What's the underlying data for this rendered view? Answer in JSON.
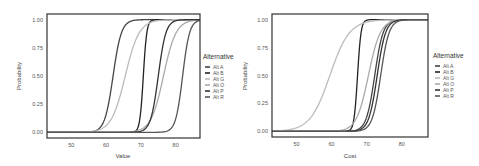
{
  "chart_data": [
    {
      "type": "line",
      "title": "",
      "xlabel": "Value",
      "ylabel": "Probability",
      "xlim": [
        43,
        87
      ],
      "ylim": [
        -0.05,
        1.05
      ],
      "xticks": [
        50,
        60,
        70,
        80
      ],
      "yticks": [
        "0.00",
        "0.25",
        "0.50",
        "0.75",
        "1.00"
      ],
      "grid": false,
      "legend": {
        "title": "Alternative",
        "placement": "right",
        "entries": [
          "Alt A",
          "Alt B",
          "Alt G",
          "Alt O",
          "Alt P",
          "Alt R"
        ]
      },
      "series": [
        {
          "name": "Alt A",
          "color": "#444444",
          "midpoint": 62.0,
          "spread": 1.2
        },
        {
          "name": "Alt B",
          "color": "#222222",
          "midpoint": 70.7,
          "spread": 0.5
        },
        {
          "name": "Alt G",
          "color": "#bbbbbb",
          "midpoint": 65.5,
          "spread": 2.0
        },
        {
          "name": "Alt O",
          "color": "#aaaaaa",
          "midpoint": 76.5,
          "spread": 1.8
        },
        {
          "name": "Alt P",
          "color": "#333333",
          "midpoint": 75.0,
          "spread": 1.1
        },
        {
          "name": "Alt R",
          "color": "#555555",
          "midpoint": 82.0,
          "spread": 1.0
        }
      ]
    },
    {
      "type": "line",
      "title": "",
      "xlabel": "Cost",
      "ylabel": "Probability",
      "xlim": [
        43,
        87.5
      ],
      "ylim": [
        -0.05,
        1.05
      ],
      "xticks": [
        50,
        60,
        70,
        80
      ],
      "yticks": [
        "0.00",
        "0.25",
        "0.50",
        "0.75",
        "1.00"
      ],
      "grid": false,
      "legend": {
        "title": "Alternative",
        "placement": "right",
        "entries": [
          "Alt A",
          "Alt B",
          "Alt G",
          "Alt O",
          "Alt P",
          "Alt R"
        ]
      },
      "series": [
        {
          "name": "Alt A",
          "color": "#444444",
          "midpoint": 72.3,
          "spread": 1.2
        },
        {
          "name": "Alt B",
          "color": "#222222",
          "midpoint": 67.4,
          "spread": 0.5
        },
        {
          "name": "Alt G",
          "color": "#bbbbbb",
          "midpoint": 59.5,
          "spread": 2.8
        },
        {
          "name": "Alt O",
          "color": "#aaaaaa",
          "midpoint": 70.5,
          "spread": 1.7
        },
        {
          "name": "Alt P",
          "color": "#333333",
          "midpoint": 73.0,
          "spread": 1.2
        },
        {
          "name": "Alt R",
          "color": "#555555",
          "midpoint": 74.0,
          "spread": 1.2
        }
      ]
    }
  ]
}
